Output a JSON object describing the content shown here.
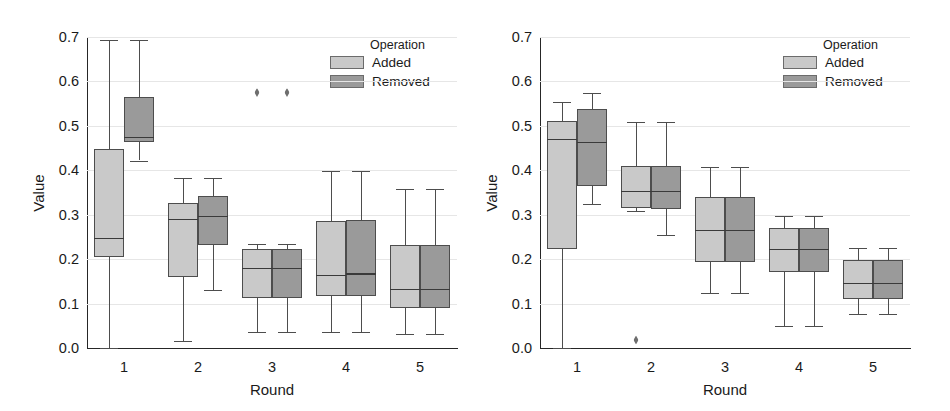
{
  "figure": {
    "width": 950,
    "height": 411,
    "background": "#ffffff",
    "panel_count": 2
  },
  "colors": {
    "added": "#c9c9c9",
    "removed": "#9a9a9a",
    "axis": "#262626",
    "grid": "#e6e6e6",
    "outlier": "#6e6e6e",
    "text": "#1a1a1a"
  },
  "legend": {
    "title": "Operation",
    "entries": [
      {
        "label": "Added",
        "color": "#c9c9c9"
      },
      {
        "label": "Removed",
        "color": "#9a9a9a"
      }
    ]
  },
  "axes": {
    "xlabel": "Round",
    "ylabel": "Value",
    "ylim": [
      0.0,
      0.7
    ],
    "yticks": [
      "0.0",
      "0.1",
      "0.2",
      "0.3",
      "0.4",
      "0.5",
      "0.6",
      "0.7"
    ],
    "ytick_values": [
      0.0,
      0.1,
      0.2,
      0.3,
      0.4,
      0.5,
      0.6,
      0.7
    ],
    "xticks": [
      "1",
      "2",
      "3",
      "4",
      "5"
    ],
    "grid": true
  },
  "chart_data": [
    {
      "type": "box",
      "panel": "left",
      "title": "",
      "xlabel": "Round",
      "ylabel": "Value",
      "ylim": [
        0.0,
        0.7
      ],
      "categories": [
        "1",
        "2",
        "3",
        "4",
        "5"
      ],
      "legend_position": "top-right",
      "series": [
        {
          "name": "Added",
          "color": "#c9c9c9",
          "boxes": [
            {
              "category": "1",
              "whisker_low": 0.0,
              "q1": 0.205,
              "median": 0.247,
              "q3": 0.447,
              "whisker_high": 0.693,
              "outliers": []
            },
            {
              "category": "2",
              "whisker_low": 0.015,
              "q1": 0.16,
              "median": 0.29,
              "q3": 0.327,
              "whisker_high": 0.383,
              "outliers": []
            },
            {
              "category": "3",
              "whisker_low": 0.035,
              "q1": 0.113,
              "median": 0.18,
              "q3": 0.222,
              "whisker_high": 0.233,
              "outliers": [
                0.575
              ]
            },
            {
              "category": "4",
              "whisker_low": 0.035,
              "q1": 0.117,
              "median": 0.165,
              "q3": 0.285,
              "whisker_high": 0.398,
              "outliers": []
            },
            {
              "category": "5",
              "whisker_low": 0.032,
              "q1": 0.09,
              "median": 0.133,
              "q3": 0.232,
              "whisker_high": 0.357,
              "outliers": []
            }
          ]
        },
        {
          "name": "Removed",
          "color": "#9a9a9a",
          "boxes": [
            {
              "category": "1",
              "whisker_low": 0.422,
              "q1": 0.463,
              "median": 0.475,
              "q3": 0.565,
              "whisker_high": 0.693,
              "outliers": []
            },
            {
              "category": "2",
              "whisker_low": 0.13,
              "q1": 0.232,
              "median": 0.298,
              "q3": 0.343,
              "whisker_high": 0.383,
              "outliers": []
            },
            {
              "category": "3",
              "whisker_low": 0.035,
              "q1": 0.113,
              "median": 0.18,
              "q3": 0.222,
              "whisker_high": 0.233,
              "outliers": [
                0.575
              ]
            },
            {
              "category": "4",
              "whisker_low": 0.035,
              "q1": 0.117,
              "median": 0.168,
              "q3": 0.287,
              "whisker_high": 0.398,
              "outliers": []
            },
            {
              "category": "5",
              "whisker_low": 0.032,
              "q1": 0.09,
              "median": 0.133,
              "q3": 0.232,
              "whisker_high": 0.357,
              "outliers": []
            }
          ]
        }
      ]
    },
    {
      "type": "box",
      "panel": "right",
      "title": "",
      "xlabel": "Round",
      "ylabel": "Value",
      "ylim": [
        0.0,
        0.7
      ],
      "categories": [
        "1",
        "2",
        "3",
        "4",
        "5"
      ],
      "legend_position": "top-right",
      "series": [
        {
          "name": "Added",
          "color": "#c9c9c9",
          "boxes": [
            {
              "category": "1",
              "whisker_low": 0.0,
              "q1": 0.222,
              "median": 0.47,
              "q3": 0.512,
              "whisker_high": 0.553,
              "outliers": []
            },
            {
              "category": "2",
              "whisker_low": 0.308,
              "q1": 0.315,
              "median": 0.353,
              "q3": 0.41,
              "whisker_high": 0.508,
              "outliers": [
                0.018
              ]
            },
            {
              "category": "3",
              "whisker_low": 0.123,
              "q1": 0.193,
              "median": 0.265,
              "q3": 0.34,
              "whisker_high": 0.408,
              "outliers": []
            },
            {
              "category": "4",
              "whisker_low": 0.05,
              "q1": 0.17,
              "median": 0.223,
              "q3": 0.27,
              "whisker_high": 0.297,
              "outliers": []
            },
            {
              "category": "5",
              "whisker_low": 0.077,
              "q1": 0.11,
              "median": 0.147,
              "q3": 0.198,
              "whisker_high": 0.225,
              "outliers": []
            }
          ]
        },
        {
          "name": "Removed",
          "color": "#9a9a9a",
          "boxes": [
            {
              "category": "1",
              "whisker_low": 0.323,
              "q1": 0.365,
              "median": 0.463,
              "q3": 0.538,
              "whisker_high": 0.575,
              "outliers": []
            },
            {
              "category": "2",
              "whisker_low": 0.255,
              "q1": 0.313,
              "median": 0.353,
              "q3": 0.41,
              "whisker_high": 0.508,
              "outliers": []
            },
            {
              "category": "3",
              "whisker_low": 0.123,
              "q1": 0.193,
              "median": 0.265,
              "q3": 0.34,
              "whisker_high": 0.408,
              "outliers": []
            },
            {
              "category": "4",
              "whisker_low": 0.05,
              "q1": 0.17,
              "median": 0.223,
              "q3": 0.27,
              "whisker_high": 0.297,
              "outliers": []
            },
            {
              "category": "5",
              "whisker_low": 0.077,
              "q1": 0.11,
              "median": 0.147,
              "q3": 0.198,
              "whisker_high": 0.225,
              "outliers": []
            }
          ]
        }
      ]
    }
  ]
}
